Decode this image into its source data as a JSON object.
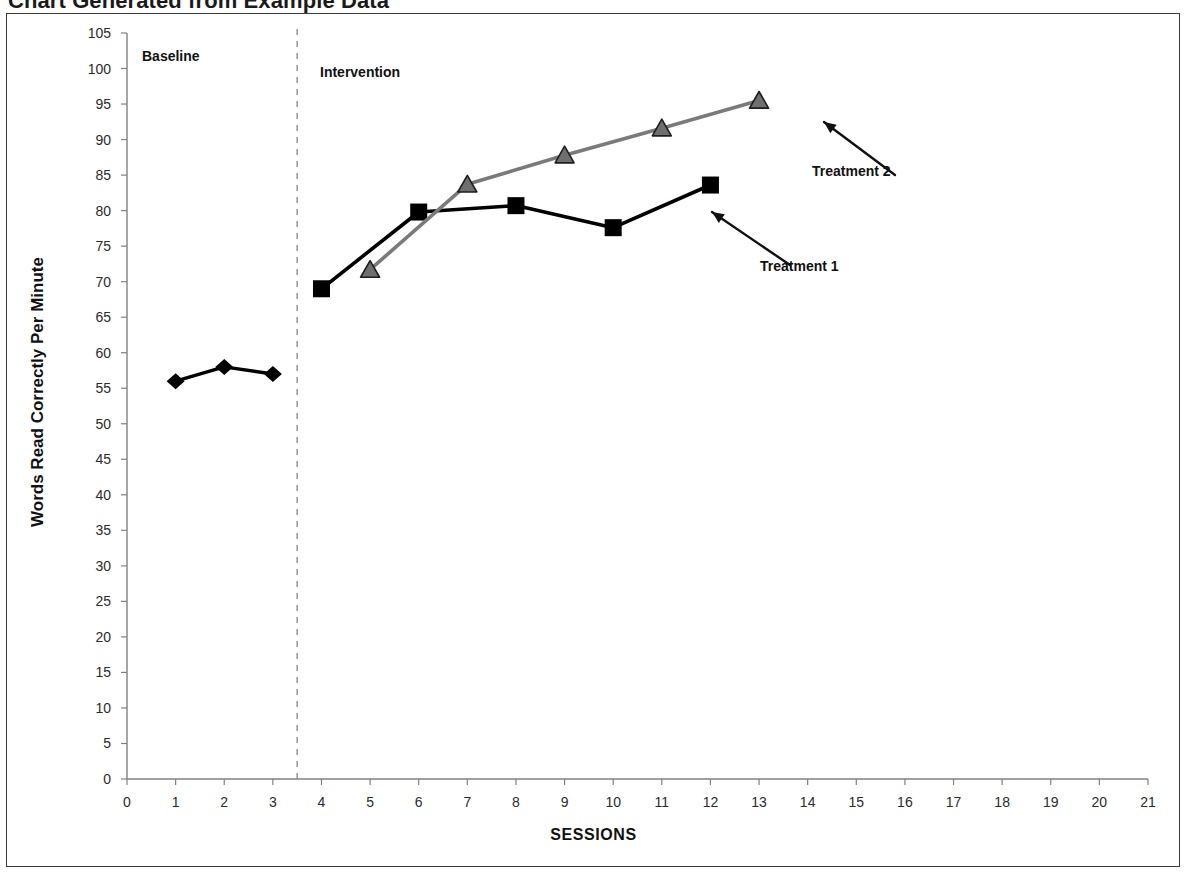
{
  "title": "Chart Generated from Example Data",
  "axes": {
    "x_title": "SESSIONS",
    "y_title": "Words Read Correctly Per Minute"
  },
  "phases": [
    {
      "name": "baseline",
      "label": "Baseline"
    },
    {
      "name": "intervention",
      "label": "Intervention"
    }
  ],
  "annotations": [
    {
      "name": "treatment-2",
      "label": "Treatment 2"
    },
    {
      "name": "treatment-1",
      "label": "Treatment 1"
    }
  ],
  "colors": {
    "baseline_series": "#000000",
    "treatment1_series": "#000000",
    "treatment2_series": "#7a7a7a",
    "axis": "#808080",
    "frame": "#3a3a3a",
    "phase_line": "#8c8c8c",
    "text": "#1a1a1a"
  },
  "chart_data": {
    "type": "line",
    "title": "Chart Generated from Example Data",
    "xlabel": "SESSIONS",
    "ylabel": "Words Read Correctly Per Minute",
    "xlim": [
      0,
      21
    ],
    "ylim": [
      0,
      105
    ],
    "xticks": [
      0,
      1,
      2,
      3,
      4,
      5,
      6,
      7,
      8,
      9,
      10,
      11,
      12,
      13,
      14,
      15,
      16,
      17,
      18,
      19,
      20,
      21
    ],
    "yticks": [
      0,
      5,
      10,
      15,
      20,
      25,
      30,
      35,
      40,
      45,
      50,
      55,
      60,
      65,
      70,
      75,
      80,
      85,
      90,
      95,
      100,
      105
    ],
    "grid": false,
    "legend": "none",
    "phase_change_line": {
      "x": 3.5,
      "style": "dashed"
    },
    "series": [
      {
        "name": "Baseline",
        "marker": "diamond",
        "color": "#000000",
        "x": [
          1,
          2,
          3
        ],
        "values": [
          56,
          58,
          57
        ]
      },
      {
        "name": "Treatment 1",
        "marker": "square",
        "color": "#000000",
        "x": [
          4,
          6,
          8,
          10,
          12
        ],
        "values": [
          69,
          79.8,
          80.7,
          77.6,
          83.6
        ]
      },
      {
        "name": "Treatment 2",
        "marker": "triangle",
        "color": "#7a7a7a",
        "x": [
          5,
          7,
          9,
          11,
          13
        ],
        "values": [
          71.7,
          83.7,
          87.8,
          91.6,
          95.5
        ]
      }
    ]
  }
}
